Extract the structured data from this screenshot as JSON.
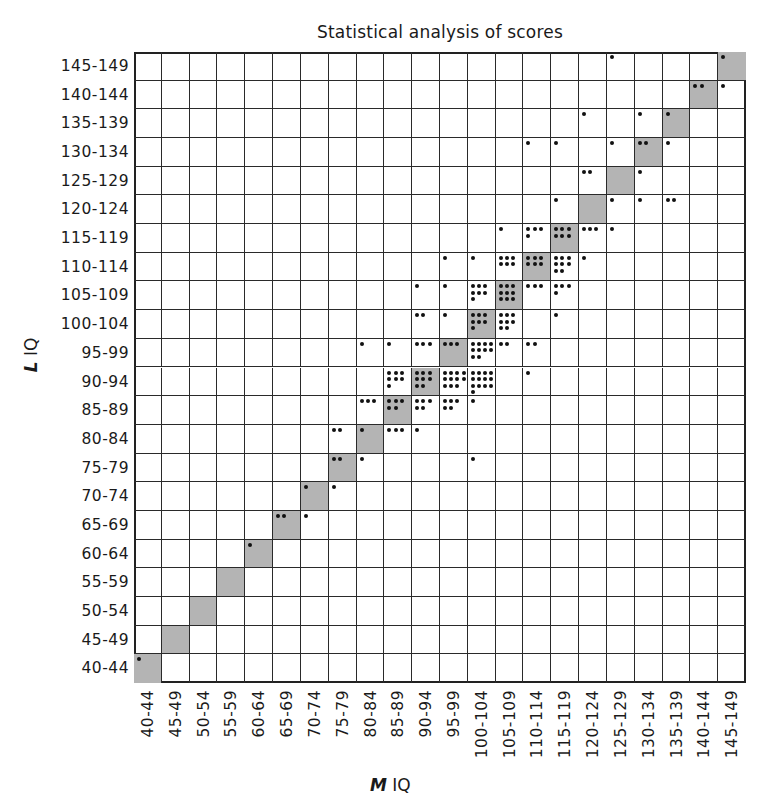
{
  "chart_data": {
    "type": "heatmap",
    "subtype": "dot-count scatter grid",
    "title": "Statistical analysis of scores",
    "xlabel_prefix": "M",
    "xlabel_suffix": "IQ",
    "ylabel_prefix": "L",
    "ylabel_suffix": "IQ",
    "x_categories": [
      "40-44",
      "45-49",
      "50-54",
      "55-59",
      "60-64",
      "65-69",
      "70-74",
      "75-79",
      "80-84",
      "85-89",
      "90-94",
      "95-99",
      "100-104",
      "105-109",
      "110-114",
      "115-119",
      "120-124",
      "125-129",
      "130-134",
      "135-139",
      "140-144",
      "145-149"
    ],
    "y_categories": [
      "40-44",
      "45-49",
      "50-54",
      "55-59",
      "60-64",
      "65-69",
      "70-74",
      "75-79",
      "80-84",
      "85-89",
      "90-94",
      "95-99",
      "100-104",
      "105-109",
      "110-114",
      "115-119",
      "120-124",
      "125-129",
      "130-134",
      "135-139",
      "140-144",
      "145-149"
    ],
    "diagonal_shaded": true,
    "shade_color": "#b4b4b4",
    "grid": true,
    "points": [
      {
        "y": "145-149",
        "x": "125-129",
        "count": 1
      },
      {
        "y": "145-149",
        "x": "145-149",
        "count": 1
      },
      {
        "y": "140-144",
        "x": "140-144",
        "count": 2
      },
      {
        "y": "140-144",
        "x": "145-149",
        "count": 1
      },
      {
        "y": "135-139",
        "x": "120-124",
        "count": 1
      },
      {
        "y": "135-139",
        "x": "130-134",
        "count": 1
      },
      {
        "y": "135-139",
        "x": "135-139",
        "count": 1
      },
      {
        "y": "130-134",
        "x": "110-114",
        "count": 1
      },
      {
        "y": "130-134",
        "x": "115-119",
        "count": 1
      },
      {
        "y": "130-134",
        "x": "125-129",
        "count": 1
      },
      {
        "y": "130-134",
        "x": "130-134",
        "count": 2
      },
      {
        "y": "130-134",
        "x": "135-139",
        "count": 1
      },
      {
        "y": "125-129",
        "x": "120-124",
        "count": 2
      },
      {
        "y": "125-129",
        "x": "130-134",
        "count": 1
      },
      {
        "y": "120-124",
        "x": "115-119",
        "count": 1
      },
      {
        "y": "120-124",
        "x": "125-129",
        "count": 1
      },
      {
        "y": "120-124",
        "x": "130-134",
        "count": 1
      },
      {
        "y": "120-124",
        "x": "135-139",
        "count": 2
      },
      {
        "y": "115-119",
        "x": "105-109",
        "count": 1
      },
      {
        "y": "115-119",
        "x": "110-114",
        "count": 4
      },
      {
        "y": "115-119",
        "x": "115-119",
        "count": 6
      },
      {
        "y": "115-119",
        "x": "120-124",
        "count": 3
      },
      {
        "y": "115-119",
        "x": "125-129",
        "count": 1
      },
      {
        "y": "110-114",
        "x": "95-99",
        "count": 1
      },
      {
        "y": "110-114",
        "x": "100-104",
        "count": 1
      },
      {
        "y": "110-114",
        "x": "105-109",
        "count": 6
      },
      {
        "y": "110-114",
        "x": "110-114",
        "count": 6
      },
      {
        "y": "110-114",
        "x": "115-119",
        "count": 8
      },
      {
        "y": "110-114",
        "x": "120-124",
        "count": 1
      },
      {
        "y": "105-109",
        "x": "90-94",
        "count": 1
      },
      {
        "y": "105-109",
        "x": "95-99",
        "count": 1
      },
      {
        "y": "105-109",
        "x": "100-104",
        "count": 7
      },
      {
        "y": "105-109",
        "x": "105-109",
        "count": 9
      },
      {
        "y": "105-109",
        "x": "110-114",
        "count": 3
      },
      {
        "y": "105-109",
        "x": "115-119",
        "count": 4
      },
      {
        "y": "100-104",
        "x": "90-94",
        "count": 2
      },
      {
        "y": "100-104",
        "x": "95-99",
        "count": 1
      },
      {
        "y": "100-104",
        "x": "100-104",
        "count": 7
      },
      {
        "y": "100-104",
        "x": "105-109",
        "count": 8
      },
      {
        "y": "100-104",
        "x": "115-119",
        "count": 1
      },
      {
        "y": "95-99",
        "x": "80-84",
        "count": 1
      },
      {
        "y": "95-99",
        "x": "85-89",
        "count": 1
      },
      {
        "y": "95-99",
        "x": "90-94",
        "count": 3
      },
      {
        "y": "95-99",
        "x": "95-99",
        "count": 3
      },
      {
        "y": "95-99",
        "x": "100-104",
        "count": 10
      },
      {
        "y": "95-99",
        "x": "105-109",
        "count": 2
      },
      {
        "y": "95-99",
        "x": "110-114",
        "count": 2
      },
      {
        "y": "90-94",
        "x": "85-89",
        "count": 7
      },
      {
        "y": "90-94",
        "x": "90-94",
        "count": 8
      },
      {
        "y": "90-94",
        "x": "95-99",
        "count": 11
      },
      {
        "y": "90-94",
        "x": "100-104",
        "count": 13
      },
      {
        "y": "90-94",
        "x": "110-114",
        "count": 1
      },
      {
        "y": "85-89",
        "x": "80-84",
        "count": 3
      },
      {
        "y": "85-89",
        "x": "85-89",
        "count": 5
      },
      {
        "y": "85-89",
        "x": "90-94",
        "count": 5
      },
      {
        "y": "85-89",
        "x": "95-99",
        "count": 5
      },
      {
        "y": "85-89",
        "x": "100-104",
        "count": 1
      },
      {
        "y": "80-84",
        "x": "75-79",
        "count": 2
      },
      {
        "y": "80-84",
        "x": "80-84",
        "count": 1
      },
      {
        "y": "80-84",
        "x": "85-89",
        "count": 3
      },
      {
        "y": "80-84",
        "x": "90-94",
        "count": 1
      },
      {
        "y": "75-79",
        "x": "75-79",
        "count": 2
      },
      {
        "y": "75-79",
        "x": "80-84",
        "count": 1
      },
      {
        "y": "75-79",
        "x": "100-104",
        "count": 1
      },
      {
        "y": "70-74",
        "x": "70-74",
        "count": 1
      },
      {
        "y": "70-74",
        "x": "75-79",
        "count": 1
      },
      {
        "y": "65-69",
        "x": "65-69",
        "count": 2
      },
      {
        "y": "65-69",
        "x": "70-74",
        "count": 1
      },
      {
        "y": "60-64",
        "x": "60-64",
        "count": 1
      },
      {
        "y": "40-44",
        "x": "40-44",
        "count": 1
      }
    ]
  }
}
